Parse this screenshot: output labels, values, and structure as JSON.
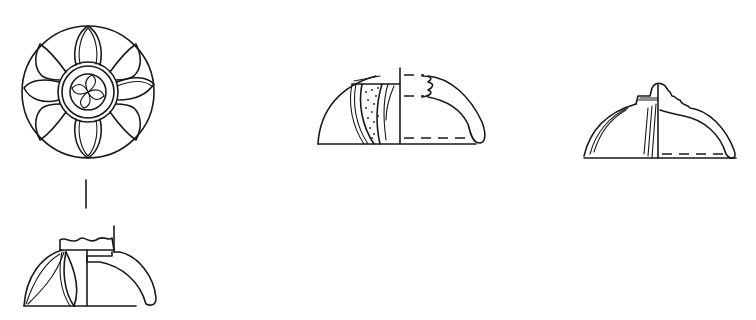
{
  "figure": {
    "type": "archaeological line drawing",
    "background": "#ffffff",
    "ink": "#1a1a1a",
    "items": [
      {
        "id": "1",
        "view": "top view",
        "description": "lotus-petal rosette lid, circular, central boss with four-lobed whorl"
      },
      {
        "id": "1b",
        "view": "side profile / section",
        "description": "half-elevation with petal decoration, half-section of dome"
      },
      {
        "id": "2",
        "view": "side profile / section",
        "description": "dome with stippled petal band, crenellated broken knob in section"
      },
      {
        "id": "3",
        "view": "side profile / section",
        "description": "dome with stepped knob, ribbed elevation, section on right"
      }
    ]
  }
}
